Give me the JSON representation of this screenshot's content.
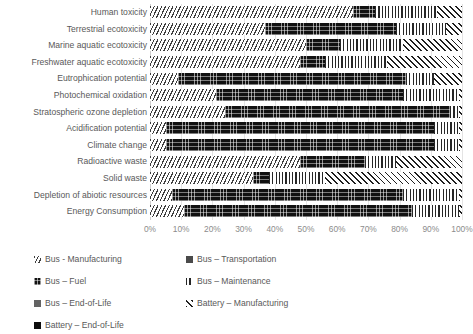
{
  "chart_data": {
    "type": "bar",
    "orientation": "horizontal",
    "stacked": true,
    "stack_mode": "percent",
    "title": "",
    "xlabel": "",
    "ylabel": "",
    "xlim": [
      0,
      100
    ],
    "xticks": [
      "0%",
      "10%",
      "20%",
      "30%",
      "40%",
      "50%",
      "60%",
      "70%",
      "80%",
      "90%",
      "100%"
    ],
    "grid": true,
    "legend_position": "bottom",
    "categories": [
      "Human toxicity",
      "Terrestrial ecotoxicity",
      "Marine aquatic ecotoxicity",
      "Freshwater aquatic ecotoxicity",
      "Eutrophication potential",
      "Photochemical oxidation",
      "Stratospheric ozone depletion",
      "Acidification potential",
      "Climate change",
      "Radioactive waste",
      "Solid waste",
      "Depletion of abiotic resources",
      "Energy Consumption"
    ],
    "series": [
      {
        "name": "Bus - Manufacturing",
        "pattern": "diagonal-hatch",
        "color": "#3f3f3f",
        "values": [
          65,
          37,
          50,
          48,
          9,
          21,
          24,
          5,
          5,
          48,
          33,
          7,
          11
        ]
      },
      {
        "name": "Bus – Transportation",
        "pattern": "solid-grey",
        "color": "#4a4a4a",
        "values": [
          0,
          0,
          0,
          0,
          0,
          0,
          0,
          0,
          0,
          0,
          0,
          0,
          0
        ]
      },
      {
        "name": "Bus – Fuel",
        "pattern": "dark-texture",
        "color": "#111111",
        "values": [
          7,
          42,
          11,
          8,
          73,
          60,
          72,
          86,
          86,
          21,
          5,
          74,
          73
        ]
      },
      {
        "name": "Bus – Maintenance",
        "pattern": "vertical-lines",
        "color": "#262626",
        "values": [
          20,
          16,
          20,
          20,
          9,
          18,
          3,
          8,
          8,
          10,
          18,
          18,
          15
        ]
      },
      {
        "name": "Bus – End-of-Life",
        "pattern": "mid-grey",
        "color": "#636363",
        "values": [
          0,
          0,
          0,
          0,
          0,
          0,
          0,
          0,
          0,
          0,
          0,
          0,
          0
        ]
      },
      {
        "name": "Battery – Manufacturing",
        "pattern": "cross-hatch-x",
        "color": "#1f1f1f",
        "values": [
          8,
          5,
          19,
          24,
          9,
          1,
          1,
          1,
          1,
          21,
          44,
          1,
          1
        ]
      },
      {
        "name": "Battery – End-of-Life",
        "pattern": "solid-black",
        "color": "#0d0d0d",
        "values": [
          0,
          0,
          0,
          0,
          0,
          0,
          0,
          0,
          0,
          0,
          0,
          0,
          0
        ]
      }
    ]
  },
  "legend": {
    "items": [
      {
        "label": "Bus - Manufacturing",
        "pattern_class": "p-diag"
      },
      {
        "label": "Bus – Transportation",
        "pattern_class": "p-solidgrey"
      },
      {
        "label": "Bus – Fuel",
        "pattern_class": "p-dark"
      },
      {
        "label": "Bus – Maintenance",
        "pattern_class": "p-vert"
      },
      {
        "label": "Bus – End-of-Life",
        "pattern_class": "p-mid"
      },
      {
        "label": "Battery – Manufacturing",
        "pattern_class": "p-x"
      },
      {
        "label": "Battery – End-of-Life",
        "pattern_class": "p-black"
      }
    ]
  }
}
